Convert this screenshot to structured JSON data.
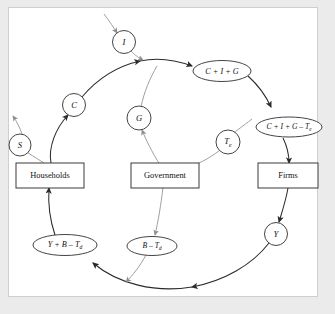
{
  "diagram": {
    "type": "circular-flow",
    "colors": {
      "page_background": "#ebebeb",
      "panel_background": "#ffffff",
      "panel_border": "#cfcfcf",
      "outer_flow_stroke": "#2b2b2b",
      "inner_flow_stroke": "#9a9a9a",
      "node_stroke": "#3a3a3a",
      "text": "#111111"
    },
    "sectors": [
      {
        "name": "households",
        "label": "Households",
        "x": 50,
        "y": 175
      },
      {
        "name": "government",
        "label": "Government",
        "x": 165,
        "y": 175
      },
      {
        "name": "firms",
        "label": "Firms",
        "x": 288,
        "y": 175
      }
    ],
    "circle_nodes": [
      {
        "name": "savings",
        "label": "S",
        "x": 20,
        "y": 145,
        "r": 11
      },
      {
        "name": "consumption",
        "label": "C",
        "x": 74,
        "y": 105,
        "r": 11.5
      },
      {
        "name": "investment",
        "label": "I",
        "x": 124,
        "y": 42,
        "r": 11.5
      },
      {
        "name": "government-spending",
        "label": "G",
        "x": 139,
        "y": 118,
        "r": 12
      },
      {
        "name": "expenditure-taxes",
        "label": "T",
        "sub": "e",
        "x": 228,
        "y": 142,
        "r": 12
      },
      {
        "name": "national-income",
        "label": "Y",
        "x": 276,
        "y": 234,
        "r": 11.5
      }
    ],
    "ellipse_nodes": [
      {
        "name": "aggregate-expenditure",
        "label": "C + I + G",
        "x": 222,
        "y": 71,
        "rx": 29,
        "ry": 10.5
      },
      {
        "name": "expenditure-net-of-taxes",
        "label": "C + I + G – T",
        "sub": "e",
        "x": 289,
        "y": 127,
        "rx": 33,
        "ry": 10
      },
      {
        "name": "disposable-income",
        "label": "Y + B – T",
        "sub": "d",
        "x": 65,
        "y": 245,
        "rx": 32,
        "ry": 10.5
      },
      {
        "name": "net-transfers",
        "label": "B – T",
        "sub": "d",
        "x": 152,
        "y": 246,
        "rx": 25,
        "ry": 9.5
      }
    ],
    "flows": [
      {
        "name": "injection-investment",
        "from": "external",
        "to": "investment",
        "style": "inner"
      },
      {
        "name": "consumption-flow",
        "from": "households",
        "to": "aggregate-expenditure",
        "style": "outer"
      },
      {
        "name": "savings-leakage",
        "from": "households",
        "to": "external",
        "style": "inner"
      },
      {
        "name": "expenditure-to-firms",
        "from": "aggregate-expenditure",
        "to": "firms",
        "style": "outer"
      },
      {
        "name": "income-to-households",
        "from": "firms",
        "to": "disposable-income",
        "style": "outer"
      },
      {
        "name": "government-spending-flow",
        "from": "government",
        "to": "aggregate-expenditure",
        "style": "inner"
      },
      {
        "name": "expenditure-tax-flow",
        "from": "firms",
        "to": "government",
        "style": "inner"
      },
      {
        "name": "transfer-flow",
        "from": "government",
        "to": "households",
        "style": "inner"
      }
    ]
  }
}
